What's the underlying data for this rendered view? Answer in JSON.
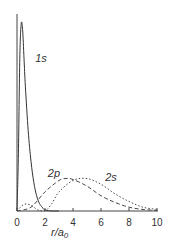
{
  "chart_data": {
    "type": "line",
    "title": "",
    "xlabel": "r/a0",
    "xlabel_main": "r/a",
    "xlabel_sub": "0",
    "ylabel": "",
    "xlim": [
      0,
      10
    ],
    "ylim": [
      0,
      1
    ],
    "grid": false,
    "legend": "none (inline curve labels)",
    "x_ticks": [
      "0",
      "2",
      "4",
      "6",
      "8",
      "10"
    ],
    "series": [
      {
        "name": "1s",
        "style": "solid",
        "x": [
          0,
          0.1,
          0.2,
          0.3,
          0.4,
          0.5,
          0.6,
          0.8,
          1.0,
          1.2,
          1.4,
          1.6,
          1.8,
          2.0,
          2.5,
          3.0
        ],
        "values": [
          0,
          0.3,
          0.8,
          0.98,
          0.95,
          0.8,
          0.65,
          0.42,
          0.26,
          0.15,
          0.08,
          0.04,
          0.02,
          0.005,
          0.0,
          0.0
        ]
      },
      {
        "name": "2p",
        "style": "dashed",
        "x": [
          0,
          1,
          2,
          3,
          3.5,
          4,
          5,
          6,
          7,
          8,
          9,
          10
        ],
        "values": [
          0,
          0.02,
          0.1,
          0.16,
          0.17,
          0.165,
          0.13,
          0.08,
          0.045,
          0.02,
          0.008,
          0.003
        ]
      },
      {
        "name": "2s",
        "style": "dotted",
        "x": [
          0,
          0.5,
          1.0,
          1.5,
          2.0,
          2.5,
          3,
          4,
          5,
          6,
          7,
          8,
          9,
          10
        ],
        "values": [
          0,
          0.035,
          0.03,
          0.005,
          0.0,
          0.04,
          0.1,
          0.16,
          0.17,
          0.14,
          0.09,
          0.05,
          0.02,
          0.008
        ]
      }
    ],
    "annotations": [
      {
        "text": "1s",
        "x": 1.3,
        "y": 0.8
      },
      {
        "text": "2p",
        "x": 2.2,
        "y": 0.2
      },
      {
        "text": "2s",
        "x": 6.3,
        "y": 0.18
      }
    ]
  }
}
